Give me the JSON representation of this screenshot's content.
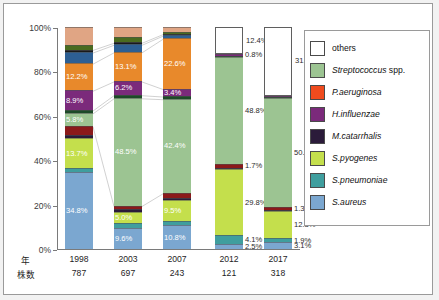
{
  "chart_data": {
    "type": "bar",
    "title": "",
    "xlabel": "",
    "ylabel": "",
    "ylim": [
      0,
      100
    ],
    "stacked": true,
    "normalized_percent": true,
    "grid": false,
    "legend_position": "right",
    "categories": [
      "1998",
      "2003",
      "2007",
      "2012",
      "2017"
    ],
    "strain_counts": [
      787,
      697,
      243,
      121,
      318
    ],
    "ytick_labels": [
      "0%",
      "20%",
      "40%",
      "60%",
      "80%",
      "100%"
    ],
    "ytick_values": [
      0,
      20,
      40,
      60,
      80,
      100
    ],
    "series": [
      {
        "name": "S.aureus",
        "color": "#7ba7d0",
        "values": [
          34.8,
          9.6,
          10.8,
          2.5,
          3.1
        ],
        "labels": [
          "34.8%",
          "9.6%",
          "10.8%",
          "2.5%",
          "3.1%"
        ]
      },
      {
        "name": "S.pneumoniae",
        "color": "#3f9e9e",
        "values": [
          1.6,
          2.0,
          1.8,
          4.1,
          1.9
        ],
        "labels": [
          "",
          "",
          "",
          "4.1%",
          "1.9%"
        ]
      },
      {
        "name": "S.pyogenes",
        "color": "#c4df4c",
        "values": [
          13.7,
          5.0,
          9.5,
          29.8,
          12.3
        ],
        "labels": [
          "13.7%",
          "5.0%",
          "9.5%",
          "29.8%",
          "12.3%"
        ]
      },
      {
        "name": "M.catarrhalis",
        "color": "#2b1b3a",
        "values": [
          1.2,
          1.6,
          1.1,
          0.9,
          0.6
        ],
        "labels": [
          "",
          "",
          "",
          "",
          ""
        ]
      },
      {
        "name": "H.influenzae",
        "color": "#8b1a1a",
        "values": [
          4.2,
          1.4,
          2.1,
          1.7,
          1.3
        ],
        "labels": [
          "",
          "",
          "",
          "1.7%",
          "1.3%"
        ]
      },
      {
        "name": "Streptococcus spp.",
        "color": "#9cc492",
        "values": [
          5.8,
          48.5,
          42.4,
          48.8,
          50.0
        ],
        "labels": [
          "5.8%",
          "48.5%",
          "42.4%",
          "48.8%",
          "50.0%"
        ]
      },
      {
        "name": "dark-green-band",
        "color": "#1d4a28",
        "values": [
          1.3,
          1.4,
          1.2,
          0.6,
          0.4
        ],
        "labels": [
          "",
          "",
          "",
          "",
          ""
        ]
      },
      {
        "name": "H.influenzae-upper",
        "color": "#7b2a7b",
        "values": [
          8.9,
          6.2,
          3.4,
          0.8,
          0.6
        ],
        "labels": [
          "8.9%",
          "6.2%",
          "3.4%",
          "0.8%",
          ""
        ]
      },
      {
        "name": "P.aeruginosa",
        "color": "#e8892b",
        "values": [
          12.2,
          13.1,
          22.6,
          0.0,
          0.0
        ],
        "labels": [
          "12.2%",
          "13.1%",
          "22.6%",
          "",
          ""
        ]
      },
      {
        "name": "blue-band",
        "color": "#2d5f93",
        "values": [
          5.0,
          3.4,
          1.4,
          0.0,
          0.0
        ],
        "labels": [
          "",
          "",
          "",
          "",
          ""
        ]
      },
      {
        "name": "dark-band",
        "color": "#1a1a1a",
        "values": [
          1.2,
          0.9,
          0.7,
          0.0,
          0.0
        ],
        "labels": [
          "",
          "",
          "",
          "",
          ""
        ]
      },
      {
        "name": "olive-band",
        "color": "#4a6b1f",
        "values": [
          2.1,
          2.3,
          1.0,
          0.0,
          0.0
        ],
        "labels": [
          "",
          "",
          "",
          "",
          ""
        ]
      },
      {
        "name": "others",
        "color": "#e0a584",
        "values": [
          8.0,
          4.6,
          2.0,
          12.4,
          31.4
        ],
        "labels": [
          "",
          "",
          "",
          "12.4%",
          "31.4%"
        ]
      }
    ],
    "others_white": {
      "note": "others rendered white with outline for 2012 and 2017",
      "values": [
        0,
        0,
        0,
        12.4,
        31.4
      ],
      "labels": [
        "",
        "",
        "",
        "12.4%",
        "31.4%"
      ]
    },
    "annotations": []
  },
  "axis": {
    "row_head_year": "年",
    "row_head_strains": "株数",
    "years": [
      "1998",
      "2003",
      "2007",
      "2012",
      "2017"
    ],
    "strains": [
      "787",
      "697",
      "243",
      "121",
      "318"
    ]
  },
  "legend": {
    "items": [
      {
        "label": "others",
        "color": "#ffffff",
        "italic": false
      },
      {
        "label": "Streptococcus spp.",
        "color": "#9cc492",
        "italic": true,
        "italic_part": "Streptococcus",
        "plain_part": " spp."
      },
      {
        "label": "P.aeruginosa",
        "color": "#ef4b1e",
        "italic": true
      },
      {
        "label": "H.influenzae",
        "color": "#7b2a7b",
        "italic": true
      },
      {
        "label": "M.catarrhalis",
        "color": "#2b1b3a",
        "italic": true
      },
      {
        "label": "S.pyogenes",
        "color": "#c4df4c",
        "italic": true
      },
      {
        "label": "S.pneumoniae",
        "color": "#3f9e9e",
        "italic": true
      },
      {
        "label": "S.aureus",
        "color": "#7ba7d0",
        "italic": true
      }
    ]
  }
}
